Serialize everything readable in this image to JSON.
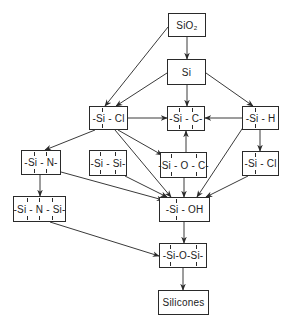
{
  "diagram": {
    "nodes": [
      {
        "id": "sio2",
        "label": "SiO₂",
        "x": 168,
        "y": 13,
        "w": 38,
        "h": 24,
        "bonds": []
      },
      {
        "id": "si",
        "label": "Si",
        "x": 167,
        "y": 59,
        "w": 39,
        "h": 26,
        "bonds": []
      },
      {
        "id": "sicl",
        "label": "-Si - Cl",
        "x": 89,
        "y": 106,
        "w": 39,
        "h": 24,
        "bonds": [
          102
        ]
      },
      {
        "id": "sic",
        "label": "-Si - C-",
        "x": 167,
        "y": 106,
        "w": 38,
        "h": 25,
        "bonds": [
          179,
          192
        ]
      },
      {
        "id": "sih",
        "label": "-Si - H",
        "x": 242,
        "y": 106,
        "w": 37,
        "h": 24,
        "bonds": [
          255
        ]
      },
      {
        "id": "sin",
        "label": "-Si - N-",
        "x": 21,
        "y": 150,
        "w": 40,
        "h": 25,
        "bonds": [
          34,
          46
        ]
      },
      {
        "id": "sisi",
        "label": "-Si - Si-",
        "x": 89,
        "y": 150,
        "w": 38,
        "h": 26,
        "bonds": [
          100,
          115
        ]
      },
      {
        "id": "sioc",
        "label": "-Si - O - C-",
        "x": 160,
        "y": 152,
        "w": 47,
        "h": 26,
        "bonds": [
          171,
          196
        ]
      },
      {
        "id": "sicl2",
        "label": "-Si - Cl",
        "x": 242,
        "y": 151,
        "w": 37,
        "h": 25,
        "bonds": [
          255
        ]
      },
      {
        "id": "sinsi",
        "label": "-Si - N - Si-",
        "x": 13,
        "y": 196,
        "w": 53,
        "h": 26,
        "bonds": [
          27,
          39,
          52
        ]
      },
      {
        "id": "sioh",
        "label": "-Si - OH",
        "x": 159,
        "y": 197,
        "w": 51,
        "h": 25,
        "bonds": [
          176
        ]
      },
      {
        "id": "siosi",
        "label": "-Si-O-Si-",
        "x": 159,
        "y": 243,
        "w": 48,
        "h": 25,
        "bonds": [
          170,
          196
        ]
      },
      {
        "id": "silicones",
        "label": "Silicones",
        "x": 158,
        "y": 290,
        "w": 51,
        "h": 25,
        "bonds": []
      }
    ],
    "edges": [
      {
        "from": "sio2",
        "to": "si",
        "x1": 187,
        "y1": 37,
        "x2": 187,
        "y2": 59
      },
      {
        "from": "sio2",
        "to": "sicl",
        "x1": 168,
        "y1": 27,
        "x2": 105,
        "y2": 106
      },
      {
        "from": "si",
        "to": "sicl",
        "x1": 167,
        "y1": 73,
        "x2": 116,
        "y2": 106
      },
      {
        "from": "si",
        "to": "sic",
        "x1": 187,
        "y1": 85,
        "x2": 187,
        "y2": 106
      },
      {
        "from": "si",
        "to": "sih",
        "x1": 206,
        "y1": 73,
        "x2": 253,
        "y2": 106
      },
      {
        "from": "sicl",
        "to": "sic",
        "x1": 128,
        "y1": 118,
        "x2": 167,
        "y2": 118
      },
      {
        "from": "sih",
        "to": "sic",
        "x1": 242,
        "y1": 118,
        "x2": 205,
        "y2": 118
      },
      {
        "from": "sioc",
        "to": "sic",
        "x1": 186,
        "y1": 152,
        "x2": 186,
        "y2": 131
      },
      {
        "from": "sicl",
        "to": "sin",
        "x1": 95,
        "y1": 130,
        "x2": 45,
        "y2": 150
      },
      {
        "from": "sicl",
        "to": "sioc",
        "x1": 118,
        "y1": 130,
        "x2": 162,
        "y2": 155
      },
      {
        "from": "sicl",
        "to": "sioh",
        "x1": 115,
        "y1": 130,
        "x2": 171,
        "y2": 197
      },
      {
        "from": "sih",
        "to": "sicl2",
        "x1": 260,
        "y1": 130,
        "x2": 260,
        "y2": 151
      },
      {
        "from": "sih",
        "to": "sioh",
        "x1": 244,
        "y1": 126,
        "x2": 197,
        "y2": 197
      },
      {
        "from": "sin",
        "to": "sinsi",
        "x1": 40,
        "y1": 175,
        "x2": 40,
        "y2": 196
      },
      {
        "from": "sin",
        "to": "sioh",
        "x1": 61,
        "y1": 172,
        "x2": 163,
        "y2": 200
      },
      {
        "from": "sisi",
        "to": "sioh",
        "x1": 125,
        "y1": 176,
        "x2": 167,
        "y2": 197
      },
      {
        "from": "sioc",
        "to": "sioh",
        "x1": 184,
        "y1": 178,
        "x2": 184,
        "y2": 197
      },
      {
        "from": "sicl2",
        "to": "sioh",
        "x1": 248,
        "y1": 176,
        "x2": 206,
        "y2": 197
      },
      {
        "from": "sioh",
        "to": "siosi",
        "x1": 184,
        "y1": 222,
        "x2": 184,
        "y2": 243
      },
      {
        "from": "sinsi",
        "to": "siosi",
        "x1": 50,
        "y1": 222,
        "x2": 159,
        "y2": 256
      },
      {
        "from": "siosi",
        "to": "silicones",
        "x1": 183,
        "y1": 268,
        "x2": 183,
        "y2": 290
      }
    ]
  }
}
